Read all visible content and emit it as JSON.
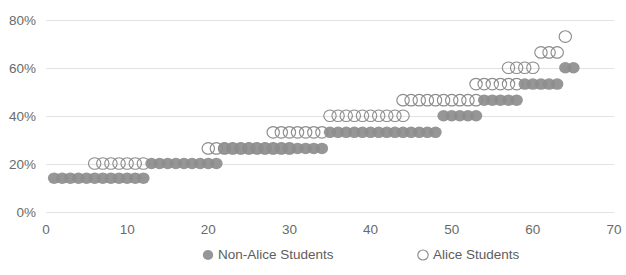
{
  "chart_data": {
    "type": "scatter",
    "title": "",
    "xlabel": "",
    "ylabel": "",
    "xlim": [
      0,
      70
    ],
    "ylim": [
      0,
      0.8
    ],
    "grid": true,
    "legend_position": "bottom",
    "x_ticks": [
      "0",
      "10",
      "20",
      "30",
      "40",
      "50",
      "60",
      "70"
    ],
    "x_tick_values": [
      0,
      10,
      20,
      30,
      40,
      50,
      60,
      70
    ],
    "y_ticks": [
      "0%",
      "20%",
      "40%",
      "60%",
      "80%"
    ],
    "y_tick_values": [
      0,
      0.2,
      0.4,
      0.6,
      0.8
    ],
    "colors": {
      "marker_gray": "#8d8d8d",
      "gridline": "#e2e2e2",
      "tick_text": "#6a6a6a",
      "legend_text": "#5d5d5d",
      "background": "#ffffff"
    },
    "series": [
      {
        "name": "Non-Alice Students",
        "marker": "filled-circle",
        "color": "#8d8d8d",
        "x": [
          1,
          2,
          3,
          4,
          5,
          6,
          7,
          8,
          9,
          10,
          11,
          12,
          13,
          14,
          15,
          16,
          17,
          18,
          19,
          20,
          21,
          22,
          23,
          24,
          25,
          26,
          27,
          28,
          29,
          30,
          31,
          32,
          33,
          34,
          35,
          36,
          37,
          38,
          39,
          40,
          41,
          42,
          43,
          44,
          45,
          46,
          47,
          48,
          49,
          50,
          51,
          52,
          53,
          54,
          55,
          56,
          57,
          58,
          59,
          60,
          61,
          62,
          63,
          64,
          65
        ],
        "y": [
          0.141,
          0.141,
          0.141,
          0.141,
          0.141,
          0.141,
          0.141,
          0.141,
          0.141,
          0.141,
          0.141,
          0.141,
          0.202,
          0.202,
          0.202,
          0.202,
          0.202,
          0.202,
          0.202,
          0.202,
          0.202,
          0.265,
          0.265,
          0.265,
          0.265,
          0.265,
          0.265,
          0.265,
          0.265,
          0.265,
          0.265,
          0.265,
          0.265,
          0.265,
          0.332,
          0.332,
          0.332,
          0.332,
          0.332,
          0.332,
          0.332,
          0.332,
          0.332,
          0.332,
          0.332,
          0.332,
          0.332,
          0.332,
          0.401,
          0.401,
          0.401,
          0.401,
          0.401,
          0.466,
          0.466,
          0.466,
          0.466,
          0.466,
          0.533,
          0.533,
          0.533,
          0.533,
          0.533,
          0.601,
          0.601
        ]
      },
      {
        "name": "Alice Students",
        "marker": "open-circle",
        "color": "#8d8d8d",
        "x": [
          6,
          7,
          8,
          9,
          10,
          11,
          12,
          20,
          21,
          22,
          23,
          24,
          25,
          26,
          27,
          28,
          29,
          30,
          28,
          29,
          30,
          31,
          32,
          33,
          34,
          35,
          36,
          37,
          38,
          39,
          40,
          41,
          42,
          43,
          44,
          44,
          45,
          46,
          47,
          48,
          49,
          50,
          51,
          52,
          53,
          53,
          54,
          55,
          56,
          57,
          58,
          57,
          58,
          59,
          60,
          61,
          62,
          63,
          64
        ],
        "y": [
          0.202,
          0.202,
          0.202,
          0.202,
          0.202,
          0.202,
          0.202,
          0.265,
          0.265,
          0.265,
          0.265,
          0.265,
          0.265,
          0.265,
          0.265,
          0.265,
          0.265,
          0.265,
          0.332,
          0.332,
          0.332,
          0.332,
          0.332,
          0.332,
          0.332,
          0.401,
          0.401,
          0.401,
          0.401,
          0.401,
          0.401,
          0.401,
          0.401,
          0.401,
          0.401,
          0.466,
          0.466,
          0.466,
          0.466,
          0.466,
          0.466,
          0.466,
          0.466,
          0.466,
          0.466,
          0.533,
          0.533,
          0.533,
          0.533,
          0.533,
          0.533,
          0.601,
          0.601,
          0.601,
          0.601,
          0.665,
          0.665,
          0.665,
          0.731
        ]
      }
    ]
  },
  "legend": {
    "items": [
      {
        "label": "Non-Alice Students",
        "marker": "filled-circle"
      },
      {
        "label": "Alice Students",
        "marker": "open-circle"
      }
    ]
  }
}
